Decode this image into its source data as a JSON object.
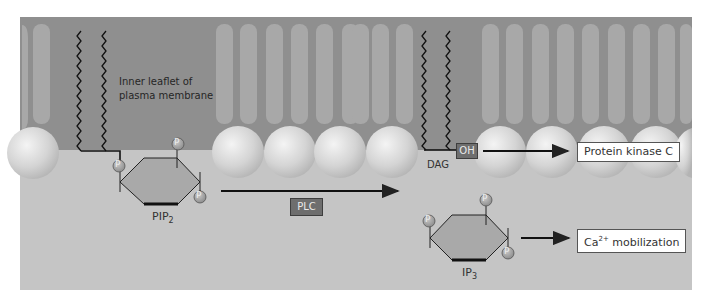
{
  "figure": {
    "colors": {
      "membrane_interior": "#8f8f8f",
      "cytosol": "#c6c6c6",
      "tail_stripe": "#a9a9a9",
      "head_sphere": "#d9d9d9",
      "inositol_ring": "#aaaaaa",
      "phosphate": "#9a9a9a",
      "enzyme_tag": "#6e6e6e"
    },
    "membrane_label": {
      "line1": "Inner leaflet of",
      "line2": "plasma membrane"
    },
    "pip2": {
      "label_main": "PIP",
      "label_sub": "2",
      "phosphate_label": "P"
    },
    "enzyme": {
      "label": "PLC"
    },
    "dag": {
      "label": "DAG",
      "hydroxyl_label": "OH"
    },
    "ip3": {
      "label_main": "IP",
      "label_sub": "3"
    },
    "outputs": {
      "pkc": "Protein kinase C",
      "ca_main": "Ca",
      "ca_sup": "2+",
      "ca_rest": " mobilization"
    }
  }
}
